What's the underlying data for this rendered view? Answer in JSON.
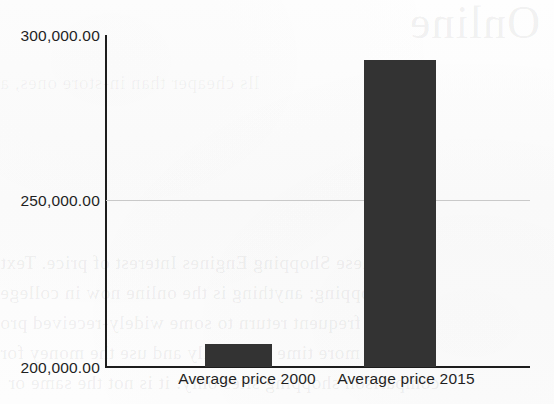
{
  "chart_data": {
    "type": "bar",
    "title": "",
    "subtitle": "",
    "xlabel": "",
    "ylabel": "",
    "categories": [
      "Average price 2000",
      "Average price 2015"
    ],
    "values": [
      206900,
      292400
    ],
    "ylim": [
      200000,
      300000
    ],
    "yticks": [
      200000,
      250000,
      300000
    ],
    "ytick_labels": [
      "200,000.00",
      "250,000.00",
      "300,000.00"
    ],
    "grid": "horizontal-only-at-250000",
    "legend": "none",
    "bar_color": "#333333",
    "axis_color": "#1d1d1d",
    "gridline_color": "#c9c9c9",
    "background_color": "#fdfdfd",
    "series": [
      {
        "name": "Average price",
        "values": [
          206900,
          292400
        ]
      }
    ]
  },
  "axis": {
    "y_labels": {
      "top": "300,000.00",
      "middle": "250,000.00",
      "bottom": "200,000.00"
    },
    "x_labels": {
      "first": "Average price 2000",
      "second": "Average price 2015"
    }
  },
  "bleed_through": {
    "title": "Online",
    "line0": "lls cheaper than in-store ones, a",
    "line1": "hese Shopping Engines Interest of price. Text",
    "line2": "nd shopping: anything is the online now in college",
    "line3": "the frequent return to some widely-received pro",
    "line4": "a more time spent only and use the money for",
    "line5": "comparison shopping sites only: it is not the same or"
  }
}
